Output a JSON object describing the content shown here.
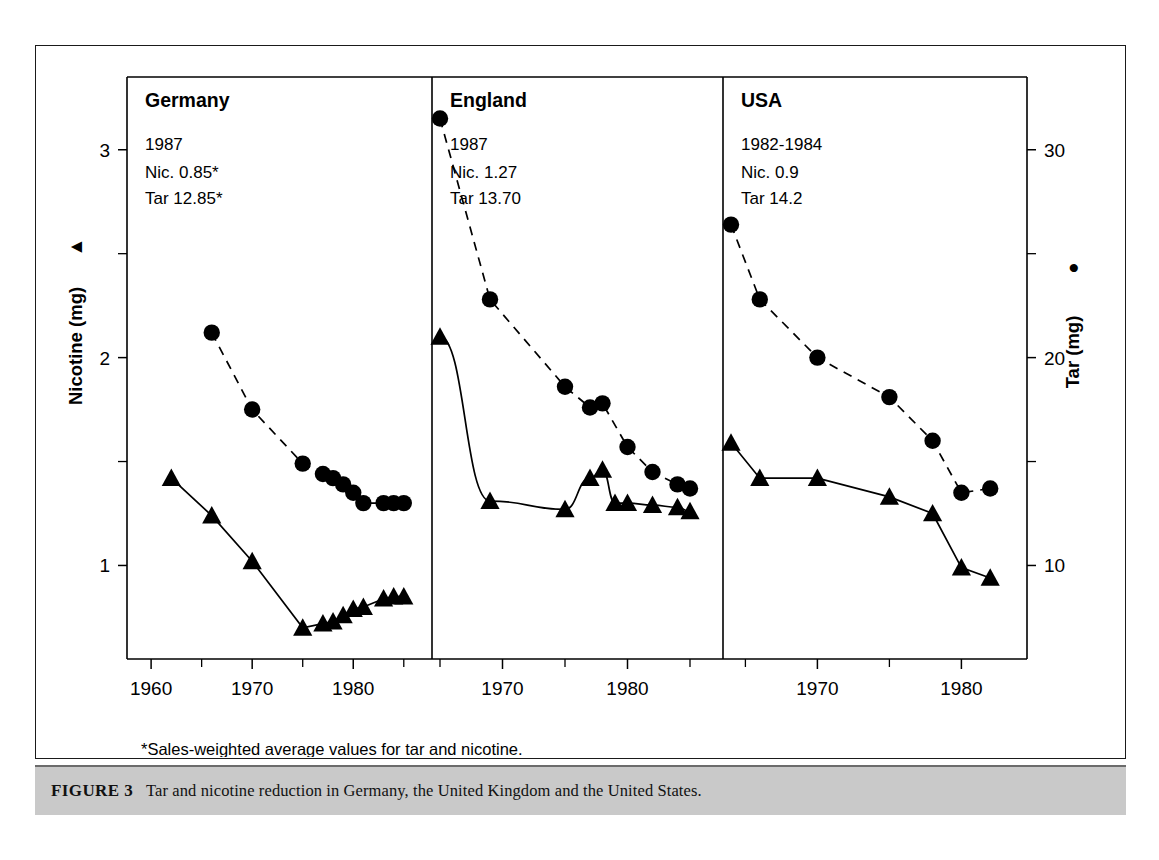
{
  "figure": {
    "caption_number": "FIGURE 3",
    "caption_text": "Tar and nicotine reduction in Germany, the United Kingdom and the United States.",
    "footnote": "*Sales-weighted average values for tar and nicotine."
  },
  "axes": {
    "left_title": "Nicotine (mg)",
    "left_glyph": "▲",
    "right_title": "Tar (mg)",
    "right_glyph": "●",
    "left_ticks": [
      "1",
      "2",
      "3"
    ],
    "left_minor_ticks": [
      "1.5",
      "2.5"
    ],
    "right_ticks": [
      "10",
      "20",
      "30"
    ],
    "right_minor_ticks": [
      "15",
      "25"
    ]
  },
  "chart_data": {
    "type": "line",
    "title": "Tar and nicotine reduction in Germany, the United Kingdom and the United States.",
    "xlabel": "",
    "ylabel": "Nicotine (mg)",
    "y2label": "Tar (mg)",
    "ylim": [
      0.55,
      3.35
    ],
    "y2lim": [
      5.5,
      33.5
    ],
    "grid": false,
    "legend": "marker-coded: triangle = Nicotine (left axis), circle = Tar (right axis)",
    "panels": [
      {
        "name": "Germany",
        "title": "Germany",
        "meta_year": "1987",
        "meta_nic": "Nic. 0.85*",
        "meta_tar": "Tar 12.85*",
        "xlim": [
          1959,
          1987
        ],
        "xticks": [
          1960,
          1970,
          1980
        ],
        "xtick_labels": [
          "1960",
          "1970",
          "1980"
        ],
        "xminor": [
          1965,
          1975,
          1985
        ],
        "series": [
          {
            "name": "Nicotine",
            "axis": "left",
            "marker": "triangle",
            "line": "solid",
            "x": [
              1962,
              1966,
              1970,
              1975,
              1977,
              1978,
              1979,
              1980,
              1981,
              1983,
              1984,
              1985
            ],
            "values": [
              1.42,
              1.24,
              1.02,
              0.7,
              0.72,
              0.73,
              0.76,
              0.79,
              0.8,
              0.84,
              0.85,
              0.85
            ]
          },
          {
            "name": "Tar",
            "axis": "right",
            "marker": "circle",
            "line": "dashed",
            "x": [
              1966,
              1970,
              1975,
              1977,
              1978,
              1979,
              1980,
              1981,
              1983,
              1984,
              1985
            ],
            "values": [
              21.2,
              17.5,
              14.9,
              14.4,
              14.2,
              13.9,
              13.5,
              13.0,
              13.0,
              13.0,
              13.0
            ]
          }
        ]
      },
      {
        "name": "England",
        "title": "England",
        "meta_year": "1987",
        "meta_nic": "Nic. 1.27",
        "meta_tar": "Tar 13.70",
        "xlim": [
          1965,
          1987
        ],
        "xticks": [
          1970,
          1980
        ],
        "xtick_labels": [
          "1970",
          "1980"
        ],
        "xminor": [
          1965,
          1975,
          1985
        ],
        "series": [
          {
            "name": "Nicotine",
            "axis": "left",
            "marker": "triangle",
            "line": "solid",
            "x": [
              1965,
              1969,
              1975,
              1977,
              1978,
              1979,
              1980,
              1982,
              1984,
              1985
            ],
            "values": [
              2.1,
              1.31,
              1.27,
              1.42,
              1.46,
              1.3,
              1.3,
              1.29,
              1.28,
              1.26
            ]
          },
          {
            "name": "Tar",
            "axis": "right",
            "marker": "circle",
            "line": "dashed",
            "x": [
              1965,
              1969,
              1975,
              1977,
              1978,
              1980,
              1982,
              1984,
              1985
            ],
            "values": [
              31.5,
              22.8,
              18.6,
              17.6,
              17.8,
              15.7,
              14.5,
              13.9,
              13.7
            ]
          }
        ]
      },
      {
        "name": "USA",
        "title": "USA",
        "meta_year": "1982-1984",
        "meta_nic": "Nic. 0.9",
        "meta_tar": "Tar 14.2",
        "xlim": [
          1964,
          1984
        ],
        "xticks": [
          1970,
          1980
        ],
        "xtick_labels": [
          "1970",
          "1980"
        ],
        "xminor": [
          1965,
          1975
        ],
        "series": [
          {
            "name": "Nicotine",
            "axis": "left",
            "marker": "triangle",
            "line": "solid",
            "x": [
              1964,
              1966,
              1970,
              1975,
              1978,
              1980,
              1982
            ],
            "values": [
              1.59,
              1.42,
              1.42,
              1.33,
              1.25,
              0.99,
              0.94
            ]
          },
          {
            "name": "Tar",
            "axis": "right",
            "marker": "circle",
            "line": "dashed",
            "x": [
              1964,
              1966,
              1970,
              1975,
              1978,
              1980,
              1982
            ],
            "values": [
              26.4,
              22.8,
              20.0,
              18.1,
              16.0,
              13.5,
              13.7
            ]
          }
        ]
      }
    ]
  }
}
